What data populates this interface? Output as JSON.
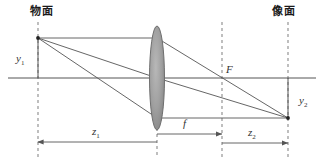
{
  "figure": {
    "type": "optics-ray-diagram",
    "background_color": "#ffffff",
    "line_color": "#555555",
    "dash_color": "#8a8a8a",
    "lens_fill": "#9a9a9a",
    "lens_stroke": "#6f6f6f",
    "text_color": "#2b2b2b"
  },
  "labels": {
    "object_plane": "物面",
    "image_plane": "像面",
    "object_height": "y",
    "object_height_sub": "1",
    "image_height": "y",
    "image_height_sub": "2",
    "focal_point": "F",
    "object_distance": "z",
    "object_distance_sub": "1",
    "focal_length": "f",
    "image_distance": "z",
    "image_distance_sub": "2"
  },
  "geometry": {
    "object_plane_x": 38,
    "lens_x": 157,
    "focal_plane_x": 222,
    "image_plane_x": 288,
    "optical_axis_y": 78,
    "object_top_y": 38,
    "image_bottom_y": 118,
    "lens_top_y": 26,
    "lens_bottom_y": 130,
    "lens_half_width": 7,
    "dash_top_y": 22,
    "dash_bottom_y": 157,
    "dim_row_z1_y": 142,
    "dim_row_f_y": 134,
    "dim_row_z2_y": 143
  },
  "label_positions": {
    "object_plane": {
      "x": 30,
      "y": 6
    },
    "image_plane": {
      "x": 272,
      "y": 6
    },
    "object_height": {
      "x": 16,
      "y": 53
    },
    "image_height": {
      "x": 299,
      "y": 95
    },
    "focal_point": {
      "x": 226,
      "y": 64
    },
    "object_distance": {
      "x": 92,
      "y": 126
    },
    "focal_length": {
      "x": 183,
      "y": 118
    },
    "image_distance": {
      "x": 248,
      "y": 127
    }
  }
}
